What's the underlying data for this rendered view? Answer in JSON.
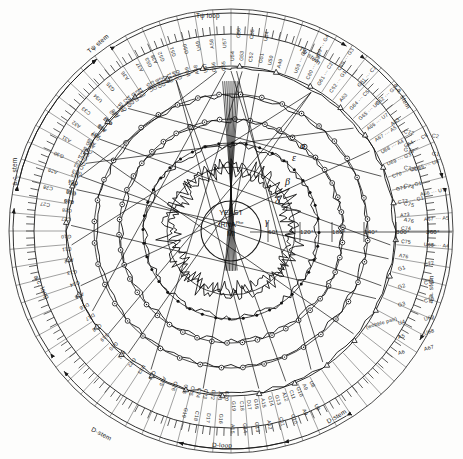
{
  "figure": {
    "center_line1": "YEAST",
    "center_line2": "tRNA",
    "center_sup": "Phe",
    "center_line3": "MI"
  },
  "angles": {
    "labels": [
      "60°",
      "120°",
      "180°",
      "240°",
      "300°",
      "360°"
    ],
    "values": [
      60,
      120,
      180,
      240,
      300,
      360
    ]
  },
  "greek": [
    {
      "sym": "α",
      "x": 300,
      "y": 140
    },
    {
      "sym": "β",
      "x": 285,
      "y": 176
    },
    {
      "sym": "γ",
      "x": 265,
      "y": 216
    },
    {
      "sym": "δ",
      "x": 275,
      "y": 195
    },
    {
      "sym": "ε",
      "x": 292,
      "y": 152
    }
  ],
  "arcs": [
    {
      "name": "t-psi-loop",
      "label": "Tψ loop",
      "x": 196,
      "y": 12,
      "rot": 0
    },
    {
      "name": "t-psi-stem",
      "label": "Tψ stem",
      "x": 88,
      "y": 48,
      "rot": -40
    },
    {
      "name": "t-psi-stem-2",
      "label": "Tψ stem",
      "x": 300,
      "y": 44,
      "rot": 38
    },
    {
      "name": "aa-stem",
      "label": "a.a. stem",
      "x": 396,
      "y": 80,
      "rot": 62
    },
    {
      "name": "ac-stem-left",
      "label": "a.c. stem",
      "x": 14,
      "y": 182,
      "rot": -90
    },
    {
      "name": "ac-loop",
      "label": "a.c. loop",
      "x": 36,
      "y": 272,
      "rot": 62
    },
    {
      "name": "d-stem",
      "label": "D-stem",
      "x": 92,
      "y": 425,
      "rot": 28
    },
    {
      "name": "d-loop",
      "label": "D-loop",
      "x": 212,
      "y": 441,
      "rot": 2
    },
    {
      "name": "d-stem-right",
      "label": "D-stem",
      "x": 327,
      "y": 418,
      "rot": -30
    },
    {
      "name": "aa-stem-right",
      "label": "a.a. stem",
      "x": 430,
      "y": 300,
      "rot": -88
    }
  ],
  "pairs_right": [
    {
      "left": "G1",
      "right": "C72",
      "y": 266
    },
    {
      "left": "G2",
      "right": "C71",
      "y": 284
    },
    {
      "left": "G3",
      "right": "C70",
      "y": 302
    },
    {
      "left": "U4",
      "right": "U69",
      "y": 320,
      "note": "(wobble pair)"
    },
    {
      "left": "A5",
      "right": "U68",
      "y": 334
    },
    {
      "left": "A6",
      "right": "A67",
      "y": 350
    }
  ],
  "pairs_upper_right": [
    {
      "left": "C72",
      "right": "C2",
      "y": 128
    },
    {
      "left": "G71",
      "right": "G1",
      "y": 146
    },
    {
      "left": "C73",
      "right": "",
      "y": 164
    },
    {
      "left": "C74",
      "right": "",
      "y": 182
    },
    {
      "left": "C75",
      "right": "",
      "y": 200
    },
    {
      "left": "A76",
      "right": "",
      "y": 216
    }
  ],
  "ring_upper_right": [
    "U59 ··· G4",
    "C60 ··· G3",
    "G61 ··· C2",
    "C62 ··· G1",
    "A63",
    "G64 ··· C5",
    "G65 ··· U6",
    "A66 ··· U7",
    "A67 ··· A5",
    "U68 ··· A4",
    "U69 ··· G3",
    "C70 ··· C2",
    "G71 ··· G1",
    "C72 ··· G1",
    "A73",
    "C74",
    "C75",
    "A76"
  ],
  "ring_top": [
    "G53",
    "G52",
    "G51",
    "G50",
    "U49",
    "A58",
    "U57",
    "G56",
    "C55",
    "U54",
    "G53",
    "C52",
    "G51",
    "U50",
    "A49"
  ],
  "ring_upper_left": [
    "C56",
    "C55",
    "G54",
    "G53",
    "G52",
    "C51",
    "A50",
    "G49",
    "A48",
    "C47",
    "A46",
    "G45",
    "G44",
    "A43"
  ],
  "ring_left": [
    "C27",
    "C28",
    "A29",
    "G30",
    "A31",
    "A32",
    "C33",
    "U34",
    "G35",
    "A36",
    "A37",
    "A38",
    "G39",
    "A40",
    "A41",
    "G42",
    "G43",
    "C44",
    "U45",
    "G46",
    "A47",
    "G48"
  ],
  "ring_lower_left": [
    "C26",
    "A25",
    "C24",
    "U23",
    "G22",
    "A21",
    "G20",
    "G19",
    "C18",
    "D17",
    "D16",
    "A15",
    "G14",
    "G13",
    "A12",
    "C11",
    "G10"
  ],
  "ring_bottom": [
    "U8",
    "A9",
    "G10",
    "C11",
    "A12",
    "G13",
    "G14",
    "A15",
    "G16",
    "D17",
    "C18",
    "G19",
    "G20",
    "A21",
    "G22",
    "C23",
    "C24",
    "C25",
    "C26"
  ],
  "section_notes": {
    "wobble": "(wobble pair)",
    "variable": "variable loop"
  },
  "colors": {
    "ink": "#1a1a1a",
    "paper": "#fdfdfc",
    "faint": "#555555"
  }
}
